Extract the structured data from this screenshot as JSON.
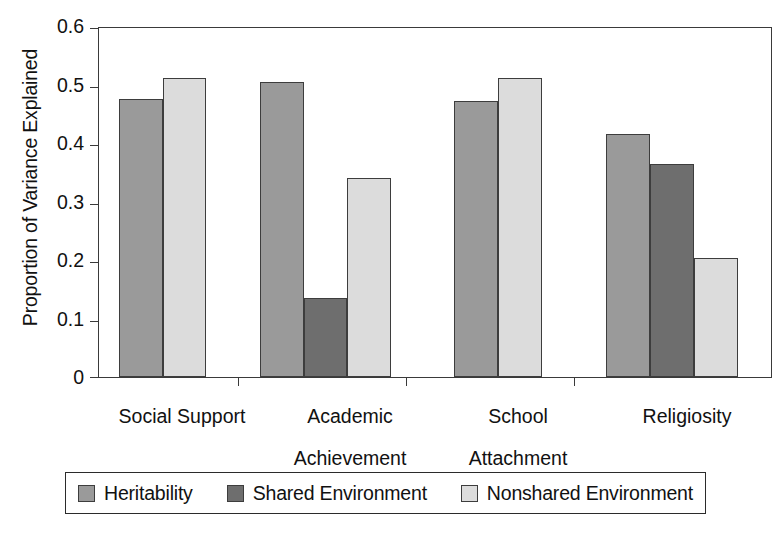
{
  "chart_data": {
    "type": "bar",
    "title": "",
    "subtitle": "",
    "xlabel": "",
    "ylabel": "Proportion of Variance Explained",
    "ylim": [
      0,
      0.6
    ],
    "yticks": [
      "0",
      "0.1",
      "0.2",
      "0.3",
      "0.4",
      "0.5",
      "0.6"
    ],
    "ytick_values": [
      0,
      0.1,
      0.2,
      0.3,
      0.4,
      0.5,
      0.6
    ],
    "grid": false,
    "legend_position": "bottom",
    "categories": [
      "Social Support",
      "Academic\nAchievement",
      "School\nAttachment",
      "Religiosity"
    ],
    "series": [
      {
        "name": "Heritability",
        "color": "#9a9a9a",
        "values": [
          0.478,
          0.508,
          0.475,
          0.417
        ]
      },
      {
        "name": "Shared Environment",
        "color": "#6e6e6e",
        "values": [
          null,
          0.136,
          null,
          0.366
        ]
      },
      {
        "name": "Nonshared Environment",
        "color": "#dcdcdc",
        "values": [
          0.514,
          0.343,
          0.514,
          0.205
        ]
      }
    ]
  },
  "axis": {
    "y_title": "Proportion of Variance Explained",
    "tick_0": "0",
    "tick_1": "0.1",
    "tick_2": "0.2",
    "tick_3": "0.3",
    "tick_4": "0.4",
    "tick_5": "0.5",
    "tick_6": "0.6"
  },
  "categories": {
    "c0": "Social Support",
    "c1_line1": "Academic",
    "c1_line2": "Achievement",
    "c2_line1": "School",
    "c2_line2": "Attachment",
    "c3": "Religiosity"
  },
  "legend": {
    "item0_label": "Heritability",
    "item1_label": "Shared Environment",
    "item2_label": "Nonshared Environment"
  },
  "colors": {
    "heritability": "#9a9a9a",
    "shared_environment": "#6e6e6e",
    "nonshared_environment": "#dcdcdc",
    "axis": "#3a3a3a",
    "bar_outline": "#3d3d3d",
    "text": "#111111",
    "background": "#ffffff"
  }
}
